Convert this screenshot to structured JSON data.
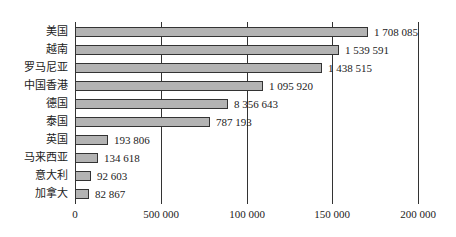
{
  "chart_data": {
    "type": "bar",
    "orientation": "horizontal",
    "title": "",
    "xlabel": "",
    "ylabel": "",
    "categories": [
      "美国",
      "越南",
      "罗马尼亚",
      "中国香港",
      "德国",
      "泰国",
      "英国",
      "马来西亚",
      "意大利",
      "加拿大"
    ],
    "value_labels": [
      "1 708 085",
      "1 539 591",
      "1 438 515",
      "1 095 920",
      "8 356 643",
      "787 193",
      "193 806",
      "134 618",
      "92 603",
      "82 867"
    ],
    "values": [
      1708085,
      1539591,
      1438515,
      1095920,
      895000,
      787193,
      193806,
      134618,
      92603,
      82867
    ],
    "values_note": "values[] are bar lengths read off the chart, assuming each gridline = 500 000; the 德国 value (895000) is an estimate from bar length, since its printed label (8 356 643) does not match the bar",
    "xticks": [
      "0",
      "500 000",
      "100 000",
      "150 000",
      "200 000"
    ],
    "xtick_positions": [
      0,
      500000,
      1000000,
      1500000,
      2000000
    ],
    "xlim": [
      0,
      2000000
    ],
    "grid": {
      "vertical": true,
      "horizontal": false
    },
    "legend": null,
    "bar_color": "#b3b3b3",
    "bar_edge_color": "#333333"
  },
  "layout": {
    "axis_x": 75,
    "plot_right": 418,
    "axis_top": 22,
    "axis_bottom": 204,
    "row_start_y": 27,
    "row_step": 18,
    "bar_height": 10,
    "tick_label_y": 208
  }
}
